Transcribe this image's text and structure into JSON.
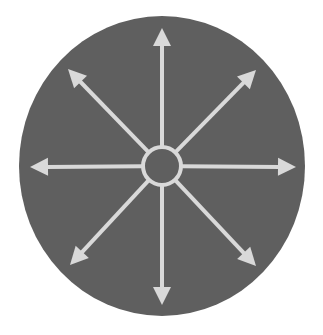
{
  "diagram": {
    "type": "radial-arrows",
    "colors": {
      "background": "#ffffff",
      "disc": "#5f5f5f",
      "arrow": "#d9d9d9"
    },
    "disc": {
      "cx": 162,
      "cy": 166,
      "rx": 143,
      "ry": 150
    },
    "hub": {
      "cx": 162,
      "cy": 166,
      "r": 19
    },
    "arrows": [
      {
        "direction": "up",
        "tip": [
          162,
          28
        ]
      },
      {
        "direction": "up-right",
        "tip": [
          256,
          70
        ]
      },
      {
        "direction": "right",
        "tip": [
          296,
          167
        ]
      },
      {
        "direction": "down-right",
        "tip": [
          256,
          266
        ]
      },
      {
        "direction": "down",
        "tip": [
          162,
          305
        ]
      },
      {
        "direction": "down-left",
        "tip": [
          70,
          265
        ]
      },
      {
        "direction": "left",
        "tip": [
          30,
          167
        ]
      },
      {
        "direction": "up-left",
        "tip": [
          68,
          69
        ]
      }
    ]
  }
}
